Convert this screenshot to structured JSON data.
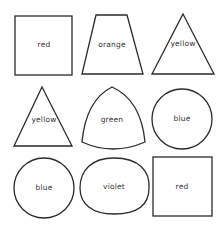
{
  "figure": {
    "shapes": [
      {
        "id": "square-1",
        "type": "square",
        "label": "red"
      },
      {
        "id": "trapezoid-1",
        "type": "trapezoid",
        "label": "orange"
      },
      {
        "id": "triangle-1",
        "type": "triangle",
        "label": "yellow"
      },
      {
        "id": "triangle-2",
        "type": "triangle",
        "label": "yellow"
      },
      {
        "id": "reuleaux-1",
        "type": "reuleaux-triangle",
        "label": "green"
      },
      {
        "id": "circle-1",
        "type": "circle",
        "label": "blue"
      },
      {
        "id": "circle-2",
        "type": "circle",
        "label": "blue"
      },
      {
        "id": "oval-1",
        "type": "oval",
        "label": "violet"
      },
      {
        "id": "square-2",
        "type": "square",
        "label": "red"
      }
    ],
    "stroke_color": "#2a2a2a",
    "fill_color": "#ffffff"
  }
}
